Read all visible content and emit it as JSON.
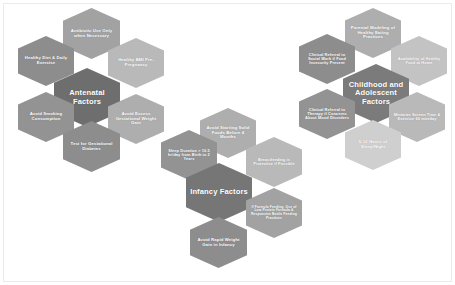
{
  "figure": {
    "background_color": "#ffffff",
    "core_color": "#6e6e6e",
    "node_color_light": "#b9b9b9",
    "node_color_mid": "#8d8d8d",
    "text_color": "#ffffff"
  },
  "clusters": [
    {
      "id": "antenatal",
      "core_label": "Antenatal Factors",
      "nodes": [
        {
          "label": "Antibiotic Use Only when Necessary"
        },
        {
          "label": "Healthy Diet & Daily Exercise"
        },
        {
          "label": "Healthy BMI Pre-Pregnancy"
        },
        {
          "label": "Avoid Smoking Consumption"
        },
        {
          "label": "Avoid Excess Gestational Weight Gain"
        },
        {
          "label": "Test for Gestational Diabetes"
        }
      ]
    },
    {
      "id": "infancy",
      "core_label": "Infancy Factors",
      "nodes": [
        {
          "label": "Avoid Starting Solid Foods Before 4 Months"
        },
        {
          "label": "Sleep Duration > 10.5 hr/day from Birth to 2 Years"
        },
        {
          "label": "Breastfeeding is Protective if Possible"
        },
        {
          "label": "If Formula Feeding, Use of Low Protein Formula & Responsive Bottle Feeding Practices"
        },
        {
          "label": "Avoid Rapid Weight Gain in Infancy"
        }
      ]
    },
    {
      "id": "childhood",
      "core_label": "Childhood and Adolescent Factors",
      "nodes": [
        {
          "label": "Parental Modeling of Healthy Eating Practices"
        },
        {
          "label": "Availability of Healthy Food at Home"
        },
        {
          "label": "Clinical Referral to Social Work if Food Insecurity Present"
        },
        {
          "label": "Clinical Referral to Therapy if Concerns About Mood Disorders"
        },
        {
          "label": "Minimize Screen Time & Exercise 60 min/day"
        },
        {
          "label": "9-12 Hours of Sleep/Night"
        }
      ]
    }
  ]
}
